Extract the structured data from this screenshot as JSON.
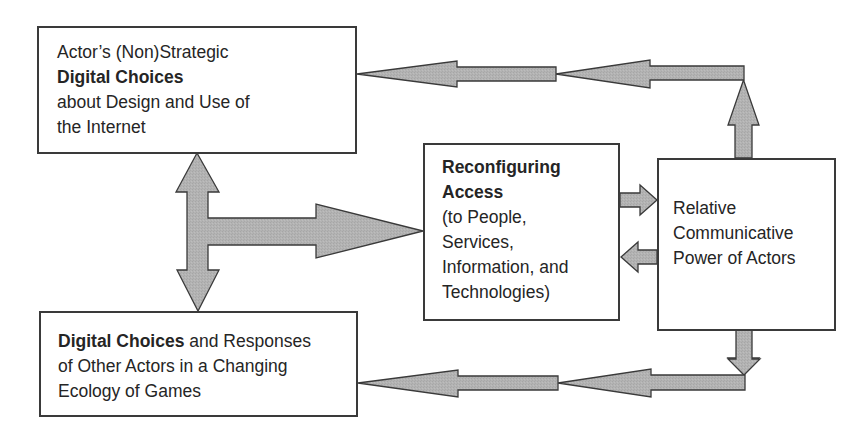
{
  "diagram": {
    "type": "flow-diagram",
    "colors": {
      "arrow_fill": "#b3b3b3",
      "arrow_stroke": "#3a3a3a",
      "box_border": "#3a3a3a",
      "text": "#252525",
      "background": "#ffffff"
    },
    "nodes": {
      "actor_choices": {
        "id": "actor_choices",
        "lines": [
          {
            "normal": "Actor’s (Non)Strategic",
            "bold": ""
          },
          {
            "normal": "",
            "bold": "Digital Choices"
          },
          {
            "normal": "about Design and Use of",
            "bold": ""
          },
          {
            "normal": "the Internet",
            "bold": ""
          }
        ]
      },
      "reconfiguring_access": {
        "id": "reconfiguring_access",
        "lines": [
          {
            "normal": "",
            "bold": "Reconfiguring"
          },
          {
            "normal": "",
            "bold": "Access"
          },
          {
            "normal": "(to People,",
            "bold": ""
          },
          {
            "normal": "Services,",
            "bold": ""
          },
          {
            "normal": "Information, and",
            "bold": ""
          },
          {
            "normal": "Technologies)",
            "bold": ""
          }
        ]
      },
      "communicative_power": {
        "id": "communicative_power",
        "lines": [
          {
            "normal": "Relative",
            "bold": ""
          },
          {
            "normal": "Communicative",
            "bold": ""
          },
          {
            "normal": "Power of Actors",
            "bold": ""
          }
        ]
      },
      "other_actors": {
        "id": "other_actors",
        "lines": [
          {
            "bold": "Digital Choices",
            "normal": " and Responses"
          },
          {
            "bold": "",
            "normal": "of Other Actors in a Changing"
          },
          {
            "bold": "",
            "normal": "Ecology of Games"
          }
        ]
      }
    },
    "edges": [
      {
        "from": "actor_choices",
        "to": "other_actors",
        "type": "bidirectional"
      },
      {
        "from": "actor_choices",
        "to": "reconfiguring_access",
        "type": "directed",
        "note": "T-junction from vertical bidirectional arrow"
      },
      {
        "from": "other_actors",
        "to": "reconfiguring_access",
        "type": "directed",
        "note": "T-junction from vertical bidirectional arrow"
      },
      {
        "from": "reconfiguring_access",
        "to": "communicative_power",
        "type": "directed"
      },
      {
        "from": "communicative_power",
        "to": "reconfiguring_access",
        "type": "directed"
      },
      {
        "from": "communicative_power",
        "to": "actor_choices",
        "type": "directed",
        "route": "up then left (two chained arrowheads)"
      },
      {
        "from": "communicative_power",
        "to": "other_actors",
        "type": "directed",
        "route": "down then left (two chained arrowheads)"
      }
    ]
  }
}
